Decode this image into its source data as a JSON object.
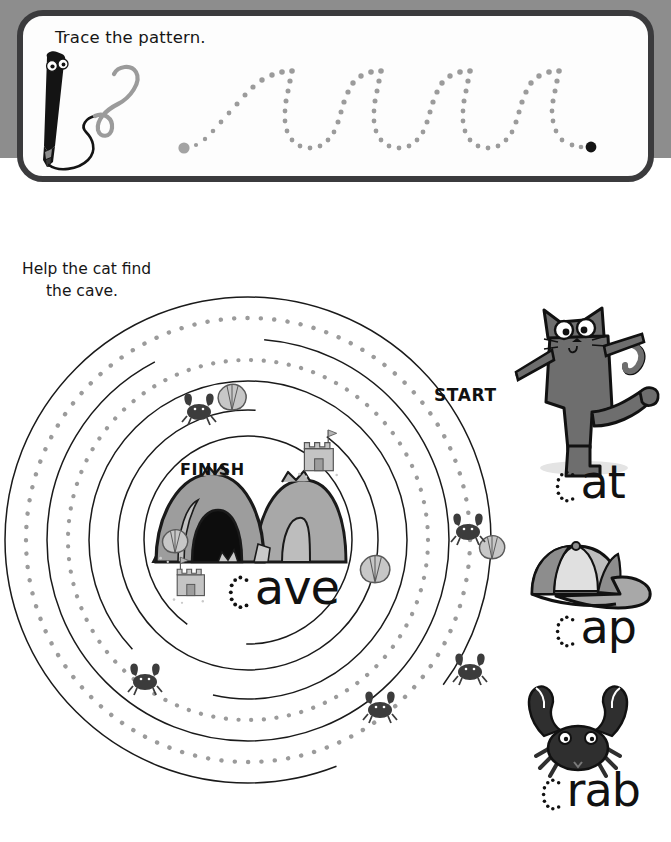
{
  "page": {
    "background_color": "#ffffff",
    "band_color": "#8d8d8d",
    "ink_color": "#111111",
    "dot_color": "#9a9a9a",
    "panel_border_color": "#3b3b3d"
  },
  "trace_exercise": {
    "title": "Trace the pattern.",
    "start_dot_color": "#a0a0a0",
    "end_dot_color": "#111111",
    "pattern_shape": "repeating-loop-wave",
    "loop_count": 4,
    "pen_character": {
      "name": "pen-character",
      "body_color": "#111111",
      "squiggle_color": "#9a9a9a"
    }
  },
  "maze": {
    "instruction_line_1": "Help the cat find",
    "instruction_line_2": "the cave.",
    "start_label": "START",
    "finish_label": "FINISH",
    "center_word": {
      "traced_letter": "c",
      "rest": "ave"
    },
    "ring_count": 8,
    "solid_ring_color": "#1a1a1a",
    "dotted_ring_color": "#9a9a9a",
    "decorations": [
      {
        "name": "crab-icon",
        "count": 6
      },
      {
        "name": "shell-icon",
        "count": 5
      },
      {
        "name": "sandcastle-icon",
        "count": 2
      },
      {
        "name": "cave-icon",
        "count": 1
      }
    ]
  },
  "word_list": [
    {
      "icon": "cat-icon",
      "traced_letter": "c",
      "rest": "at",
      "icon_color": "#6e6e6e"
    },
    {
      "icon": "cap-icon",
      "traced_letter": "c",
      "rest": "ap",
      "icon_color": "#8f8f8f"
    },
    {
      "icon": "crab-icon",
      "traced_letter": "c",
      "rest": "rab",
      "icon_color": "#3a3a3a"
    }
  ]
}
